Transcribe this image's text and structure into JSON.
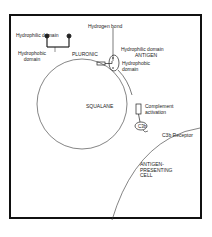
{
  "diagram": {
    "legend": {
      "hydrophilic": "Hydrophilic domain",
      "hydrophobic": "Hydrophobic domain"
    },
    "labels": {
      "pluronic": "PLURONIC",
      "hydrogen_bond": "Hydrogen bond",
      "hydrophilic_domain": "Hydrophilic domain",
      "antigen": "ANTIGEN",
      "hydrophobic_domain": "Hydrophobic domain",
      "squalane": "SQUALANE",
      "complement_activation": "Complement activation",
      "c3b": "C3b",
      "c3b_receptor": "C3b Receptor",
      "apc": "ANTIGEN-PRESENTING CELL"
    },
    "colors": {
      "line": "#222222",
      "frame": "#111111",
      "background": "#ffffff"
    }
  }
}
